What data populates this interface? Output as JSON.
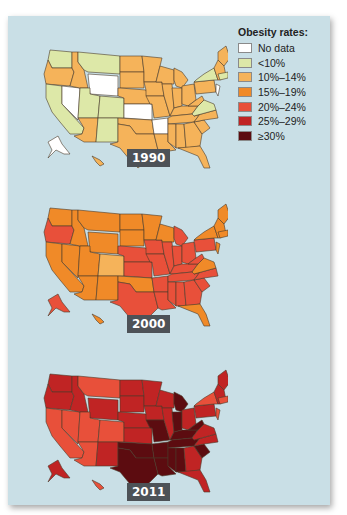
{
  "chart_data": {
    "type": "choropleth-map",
    "legend": {
      "title": "Obesity rates:",
      "position": "top-right",
      "entries": [
        {
          "label": "No data",
          "color": "#ffffff"
        },
        {
          "label": "<10%",
          "color": "#dde8a8"
        },
        {
          "label": "10%–14%",
          "color": "#f5b35a"
        },
        {
          "label": "15%–19%",
          "color": "#f08a28"
        },
        {
          "label": "20%–24%",
          "color": "#e8503a"
        },
        {
          "label": "25%–29%",
          "color": "#c02424"
        },
        {
          "label": "≥30%",
          "color": "#5c0c10"
        }
      ]
    },
    "maps": [
      {
        "year": "1990",
        "regions": {
          "WA": "<10%",
          "OR": "10%–14%",
          "CA": "<10%",
          "NV": "No data",
          "ID": "10%–14%",
          "MT": "<10%",
          "WY": "No data",
          "UT": "<10%",
          "CO": "<10%",
          "AZ": "10%–14%",
          "NM": "<10%",
          "ND": "10%–14%",
          "SD": "10%–14%",
          "NE": "10%–14%",
          "KS": "No data",
          "OK": "10%–14%",
          "TX": "10%–14%",
          "MN": "10%–14%",
          "IA": "10%–14%",
          "MO": "10%–14%",
          "AR": "No data",
          "LA": "10%–14%",
          "WI": "10%–14%",
          "IL": "10%–14%",
          "MI": "10%–14%",
          "IN": "10%–14%",
          "OH": "10%–14%",
          "KY": "10%–14%",
          "TN": "10%–14%",
          "MS": "10%–14%",
          "AL": "10%–14%",
          "GA": "10%–14%",
          "FL": "10%–14%",
          "SC": "10%–14%",
          "NC": "10%–14%",
          "VA": "<10%",
          "WV": "10%–14%",
          "PA": "10%–14%",
          "NY": "<10%",
          "NJ": "No data",
          "New England": "10%–14%",
          "ME": "10%–14%",
          "MA": "<10%",
          "AK": "No data",
          "HI": "10%–14%"
        }
      },
      {
        "year": "2000",
        "regions": {
          "WA": "15%–19%",
          "OR": "20%–24%",
          "CA": "15%–19%",
          "NV": "15%–19%",
          "ID": "15%–19%",
          "MT": "15%–19%",
          "WY": "15%–19%",
          "UT": "15%–19%",
          "CO": "10%–14%",
          "AZ": "15%–19%",
          "NM": "15%–19%",
          "ND": "15%–19%",
          "SD": "15%–19%",
          "NE": "20%–24%",
          "KS": "20%–24%",
          "OK": "15%–19%",
          "TX": "20%–24%",
          "MN": "15%–19%",
          "IA": "20%–24%",
          "MO": "20%–24%",
          "AR": "20%–24%",
          "LA": "20%–24%",
          "WI": "15%–19%",
          "IL": "20%–24%",
          "MI": "20%–24%",
          "IN": "20%–24%",
          "OH": "20%–24%",
          "KY": "20%–24%",
          "TN": "20%–24%",
          "MS": "20%–24%",
          "AL": "20%–24%",
          "GA": "20%–24%",
          "FL": "15%–19%",
          "SC": "20%–24%",
          "NC": "20%–24%",
          "VA": "15%–19%",
          "WV": "20%–24%",
          "PA": "20%–24%",
          "NY": "15%–19%",
          "NJ": "15%–19%",
          "New England": "15%–19%",
          "ME": "15%–19%",
          "MA": "15%–19%",
          "AK": "20%–24%",
          "HI": "15%–19%"
        }
      },
      {
        "year": "2011",
        "regions": {
          "WA": "25%–29%",
          "OR": "25%–29%",
          "CA": "20%–24%",
          "NV": "20%–24%",
          "ID": "25%–29%",
          "MT": "20%–24%",
          "WY": "25%–29%",
          "UT": "20%–24%",
          "CO": "20%–24%",
          "AZ": "20%–24%",
          "NM": "25%–29%",
          "ND": "25%–29%",
          "SD": "25%–29%",
          "NE": "25%–29%",
          "KS": "25%–29%",
          "OK": "≥30%",
          "TX": "≥30%",
          "MN": "25%–29%",
          "IA": "25%–29%",
          "MO": "≥30%",
          "AR": "≥30%",
          "LA": "≥30%",
          "WI": "25%–29%",
          "IL": "25%–29%",
          "MI": "≥30%",
          "IN": "≥30%",
          "OH": "25%–29%",
          "KY": "≥30%",
          "TN": "≥30%",
          "MS": "≥30%",
          "AL": "≥30%",
          "GA": "25%–29%",
          "FL": "25%–29%",
          "SC": "≥30%",
          "NC": "25%–29%",
          "VA": "25%–29%",
          "WV": "≥30%",
          "PA": "25%–29%",
          "NY": "20%–24%",
          "NJ": "20%–24%",
          "New England": "25%–29%",
          "ME": "25%–29%",
          "MA": "20%–24%",
          "AK": "25%–29%",
          "HI": "20%–24%"
        }
      }
    ]
  },
  "legend": {
    "title": "Obesity rates:",
    "items": [
      {
        "label": "No data",
        "color": "#ffffff"
      },
      {
        "label": "<10%",
        "color": "#dde8a8"
      },
      {
        "label": "10%–14%",
        "color": "#f5b35a"
      },
      {
        "label": "15%–19%",
        "color": "#f08a28"
      },
      {
        "label": "20%–24%",
        "color": "#e8503a"
      },
      {
        "label": "25%–29%",
        "color": "#c02424"
      },
      {
        "label": "≥30%",
        "color": "#5c0c10"
      }
    ]
  },
  "maps": [
    {
      "year": "1990"
    },
    {
      "year": "2000"
    },
    {
      "year": "2011"
    }
  ]
}
